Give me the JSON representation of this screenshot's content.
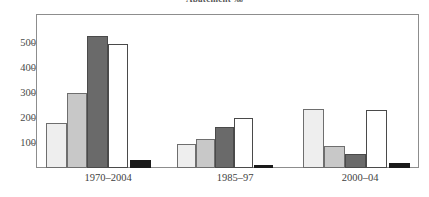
{
  "chart_data": {
    "type": "bar",
    "title": "Abatement ‰",
    "xlabel": "",
    "ylabel": "",
    "ylim": [
      0,
      560
    ],
    "yticks": [
      100,
      200,
      300,
      400,
      500
    ],
    "ytick_labels": [
      "100",
      "200",
      "300",
      "400",
      "500"
    ],
    "grid": false,
    "legend": "none",
    "categories": [
      "1970–2004",
      "1985–97",
      "2000–04"
    ],
    "series": [
      {
        "name": "series-1",
        "color": "#eeeeee",
        "edge": "#6e6e6e",
        "values": [
          180,
          96,
          233
        ]
      },
      {
        "name": "series-2",
        "color": "#c8c8c8",
        "edge": "#6e6e6e",
        "values": [
          300,
          115,
          88
        ]
      },
      {
        "name": "series-3",
        "color": "#6a6a6a",
        "edge": "#4a4a4a",
        "values": [
          525,
          162,
          56
        ]
      },
      {
        "name": "series-4",
        "color": "#ffffff",
        "edge": "#4a4a4a",
        "values": [
          495,
          197,
          230
        ]
      },
      {
        "name": "series-5",
        "color": "#1a1a1a",
        "edge": "#1a1a1a",
        "values": [
          30,
          10,
          18
        ]
      }
    ]
  },
  "axes": {
    "y_tick_100": "100",
    "y_tick_200": "200",
    "y_tick_300": "300",
    "y_tick_400": "400",
    "y_tick_500": "500",
    "x_label_1": "1970–2004",
    "x_label_2": "1985–97",
    "x_label_3": "2000–04"
  },
  "figure": {
    "title": "Abatement ‰",
    "background": "#ffffff",
    "frame_color": "#8d8d8d"
  }
}
